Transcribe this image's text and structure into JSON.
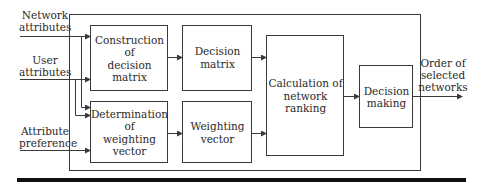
{
  "diagram": {
    "inputs": [
      {
        "id": "network",
        "label_line1": "Network",
        "label_line2": "attributes"
      },
      {
        "id": "user",
        "label_line1": "User",
        "label_line2": "attributes"
      },
      {
        "id": "preference",
        "label_line1": "Attribute",
        "label_line2": "preference"
      }
    ],
    "blocks": {
      "construction": {
        "line1": "Construction of",
        "line2": "decision matrix"
      },
      "decision_matrix": {
        "line1": "Decision matrix"
      },
      "determination": {
        "line1": "Determination of",
        "line2": "weighting vector"
      },
      "weighting_vector": {
        "line1": "Weighting",
        "line2": "vector"
      },
      "calculation": {
        "line1": "Calculation of",
        "line2": "network ranking"
      },
      "decision_making": {
        "line1": "Decision",
        "line2": "making"
      }
    },
    "output": {
      "line1": "Order of",
      "line2": "selected",
      "line3": "networks"
    },
    "colors": {
      "line": "#3a3a3a",
      "bar": "#111111"
    }
  }
}
